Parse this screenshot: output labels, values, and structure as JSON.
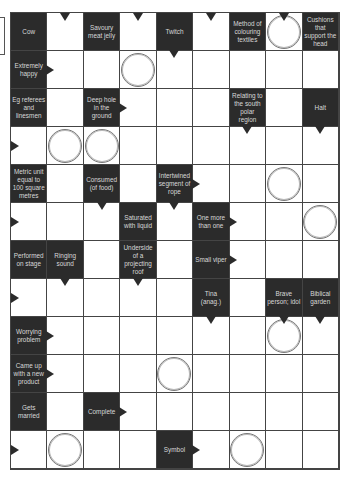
{
  "puzzle": {
    "type": "arrowword",
    "columns": 9,
    "rows": 12,
    "colors": {
      "clue_bg": "#2b2b2b",
      "clue_text": "#d8d8d8",
      "grid_line": "#444444"
    },
    "clues": {
      "r0c0": "Cow",
      "r0c2": "Savoury meat jelly",
      "r0c4": "Twitch",
      "r0c6": "Method of colouring textiles",
      "r0c8": "Cushions that support the head",
      "r1c0": "Extremely happy",
      "r2c0": "Eg referees and linesmen",
      "r2c2": "Deep hole in the ground",
      "r2c6": "Relating to the south polar region",
      "r2c8": "Halt",
      "r4c0": "Metric unit equal to 100 square metres",
      "r4c2": "Consumed (of food)",
      "r4c4": "Intertwined segment of rope",
      "r5c3": "Saturated with liquid",
      "r5c5": "One more than one",
      "r6c0": "Performed on stage",
      "r6c1": "Ringing sound",
      "r6c3": "Underside of a projecting roof",
      "r6c5": "Small viper",
      "r7c5": "Tina (anag.)",
      "r7c7": "Brave person; idol",
      "r7c8": "Biblical garden",
      "r8c0": "Worrying problem",
      "r9c0": "Came up with a new product",
      "r10c0": "Gets married",
      "r10c2": "Complete",
      "r11c4": "Symbol"
    },
    "circled_cells": [
      "r0c7",
      "r1c3",
      "r3c1",
      "r3c2",
      "r4c7",
      "r5c8",
      "r8c7",
      "r9c4",
      "r11c1",
      "r11c6"
    ]
  }
}
